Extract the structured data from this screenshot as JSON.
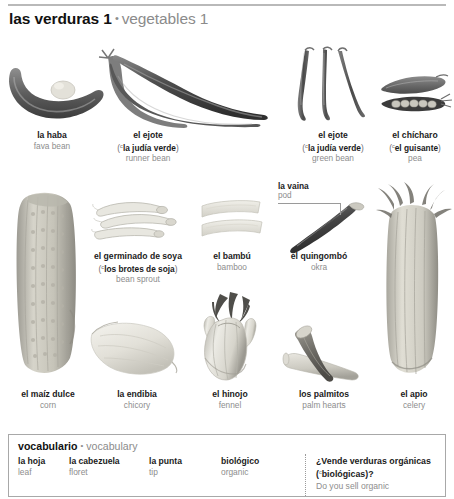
{
  "header": {
    "title_es": "las verduras 1",
    "bullet": "•",
    "title_en": "vegetables 1"
  },
  "variant_marker": "c",
  "items": [
    {
      "id": "fava-bean",
      "es": "la haba",
      "alt": "",
      "en": "fava bean"
    },
    {
      "id": "runner-bean",
      "es": "el ejote",
      "alt": "la judía verde",
      "en": "runner bean"
    },
    {
      "id": "green-bean",
      "es": "el ejote",
      "alt": "la judía verde",
      "en": "green bean"
    },
    {
      "id": "pea",
      "es": "el chícharo",
      "alt": "el guisante",
      "en": "pea"
    },
    {
      "id": "bean-sprout",
      "es": "el germinado de soya",
      "alt": "los brotes de soja",
      "en": "bean sprout"
    },
    {
      "id": "bamboo",
      "es": "el bambú",
      "alt": "",
      "en": "bamboo"
    },
    {
      "id": "okra",
      "es": "el quingombó",
      "alt": "",
      "en": "okra"
    },
    {
      "id": "corn",
      "es": "el maíz dulce",
      "alt": "",
      "en": "corn"
    },
    {
      "id": "chicory",
      "es": "la endibia",
      "alt": "",
      "en": "chicory"
    },
    {
      "id": "fennel",
      "es": "el hinojo",
      "alt": "",
      "en": "fennel"
    },
    {
      "id": "palm-hearts",
      "es": "los palmitos",
      "alt": "",
      "en": "palm hearts"
    },
    {
      "id": "celery",
      "es": "el apio",
      "alt": "",
      "en": "celery"
    }
  ],
  "callouts": [
    {
      "id": "pod",
      "es": "la vaina",
      "en": "pod"
    }
  ],
  "vocabulary": {
    "title_es": "vocabulario",
    "bullet": "•",
    "title_en": "vocabulary",
    "terms": [
      {
        "es": "la hoja",
        "en": "leaf"
      },
      {
        "es": "la cabezuela",
        "en": "floret"
      },
      {
        "es": "la punta",
        "en": "tip"
      },
      {
        "es": "biológico",
        "en": "organic"
      }
    ],
    "phrase": {
      "es_line1": "¿Vende verduras orgánicas",
      "es_line2_alt": "biológicas",
      "es_line2_tail": ")?",
      "es_line2_head": "(",
      "en": "Do you sell organic"
    }
  }
}
